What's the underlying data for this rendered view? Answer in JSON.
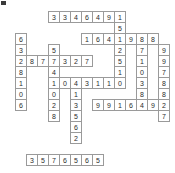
{
  "puzzle": {
    "title": "Number Crossword Grid",
    "type": "number-crossword",
    "grid_columns": 16,
    "grid_rows": 15,
    "cell_size_px": 11,
    "origin_x_px": 4,
    "origin_y_px": 11,
    "colors": {
      "cell_border": "#9a9a9a",
      "cell_background": "#ffffff",
      "digit_text": "#2b2b2b",
      "page_background": "#ffffff",
      "corner_mark": "#3a3a3a"
    },
    "cells": [
      {
        "col": 4,
        "row": 0,
        "value": "3"
      },
      {
        "col": 5,
        "row": 0,
        "value": "3"
      },
      {
        "col": 6,
        "row": 0,
        "value": "4"
      },
      {
        "col": 7,
        "row": 0,
        "value": "6"
      },
      {
        "col": 8,
        "row": 0,
        "value": "4"
      },
      {
        "col": 9,
        "row": 0,
        "value": "9"
      },
      {
        "col": 10,
        "row": 0,
        "value": "1"
      },
      {
        "col": 10,
        "row": 1,
        "value": "5"
      },
      {
        "col": 7,
        "row": 2,
        "value": "1"
      },
      {
        "col": 8,
        "row": 2,
        "value": "6"
      },
      {
        "col": 9,
        "row": 2,
        "value": "4"
      },
      {
        "col": 10,
        "row": 2,
        "value": "1"
      },
      {
        "col": 11,
        "row": 2,
        "value": "9"
      },
      {
        "col": 12,
        "row": 2,
        "value": "8"
      },
      {
        "col": 13,
        "row": 2,
        "value": "8"
      },
      {
        "col": 1,
        "row": 2,
        "value": "6"
      },
      {
        "col": 1,
        "row": 3,
        "value": "3"
      },
      {
        "col": 1,
        "row": 4,
        "value": "2"
      },
      {
        "col": 1,
        "row": 5,
        "value": "8"
      },
      {
        "col": 1,
        "row": 6,
        "value": "1"
      },
      {
        "col": 1,
        "row": 7,
        "value": "0"
      },
      {
        "col": 1,
        "row": 8,
        "value": "6"
      },
      {
        "col": 4,
        "row": 3,
        "value": "5"
      },
      {
        "col": 4,
        "row": 4,
        "value": "7"
      },
      {
        "col": 4,
        "row": 5,
        "value": "4"
      },
      {
        "col": 4,
        "row": 6,
        "value": "1"
      },
      {
        "col": 4,
        "row": 7,
        "value": "0"
      },
      {
        "col": 4,
        "row": 8,
        "value": "2"
      },
      {
        "col": 4,
        "row": 9,
        "value": "8"
      },
      {
        "col": 2,
        "row": 4,
        "value": "8"
      },
      {
        "col": 3,
        "row": 4,
        "value": "7"
      },
      {
        "col": 5,
        "row": 4,
        "value": "3"
      },
      {
        "col": 6,
        "row": 4,
        "value": "2"
      },
      {
        "col": 7,
        "row": 4,
        "value": "7"
      },
      {
        "col": 10,
        "row": 3,
        "value": "2"
      },
      {
        "col": 10,
        "row": 4,
        "value": "5"
      },
      {
        "col": 10,
        "row": 5,
        "value": "1"
      },
      {
        "col": 10,
        "row": 6,
        "value": "0"
      },
      {
        "col": 12,
        "row": 3,
        "value": "7"
      },
      {
        "col": 12,
        "row": 4,
        "value": "1"
      },
      {
        "col": 12,
        "row": 5,
        "value": "0"
      },
      {
        "col": 12,
        "row": 6,
        "value": "3"
      },
      {
        "col": 12,
        "row": 7,
        "value": "8"
      },
      {
        "col": 14,
        "row": 3,
        "value": "9"
      },
      {
        "col": 14,
        "row": 4,
        "value": "9"
      },
      {
        "col": 14,
        "row": 5,
        "value": "7"
      },
      {
        "col": 14,
        "row": 6,
        "value": "8"
      },
      {
        "col": 14,
        "row": 7,
        "value": "8"
      },
      {
        "col": 14,
        "row": 8,
        "value": "2"
      },
      {
        "col": 14,
        "row": 9,
        "value": "7"
      },
      {
        "col": 5,
        "row": 6,
        "value": "0"
      },
      {
        "col": 6,
        "row": 6,
        "value": "4"
      },
      {
        "col": 7,
        "row": 6,
        "value": "3"
      },
      {
        "col": 8,
        "row": 6,
        "value": "1"
      },
      {
        "col": 9,
        "row": 6,
        "value": "1"
      },
      {
        "col": 6,
        "row": 7,
        "value": "1"
      },
      {
        "col": 6,
        "row": 8,
        "value": "3"
      },
      {
        "col": 6,
        "row": 9,
        "value": "5"
      },
      {
        "col": 6,
        "row": 10,
        "value": "6"
      },
      {
        "col": 6,
        "row": 11,
        "value": "2"
      },
      {
        "col": 8,
        "row": 8,
        "value": "9"
      },
      {
        "col": 9,
        "row": 8,
        "value": "9"
      },
      {
        "col": 10,
        "row": 8,
        "value": "1"
      },
      {
        "col": 11,
        "row": 8,
        "value": "6"
      },
      {
        "col": 12,
        "row": 8,
        "value": "4"
      },
      {
        "col": 13,
        "row": 8,
        "value": "9"
      },
      {
        "col": 2,
        "row": 13,
        "value": "3"
      },
      {
        "col": 3,
        "row": 13,
        "value": "5"
      },
      {
        "col": 4,
        "row": 13,
        "value": "7"
      },
      {
        "col": 5,
        "row": 13,
        "value": "6"
      },
      {
        "col": 6,
        "row": 13,
        "value": "5"
      },
      {
        "col": 7,
        "row": 13,
        "value": "6"
      },
      {
        "col": 8,
        "row": 13,
        "value": "5"
      }
    ]
  }
}
